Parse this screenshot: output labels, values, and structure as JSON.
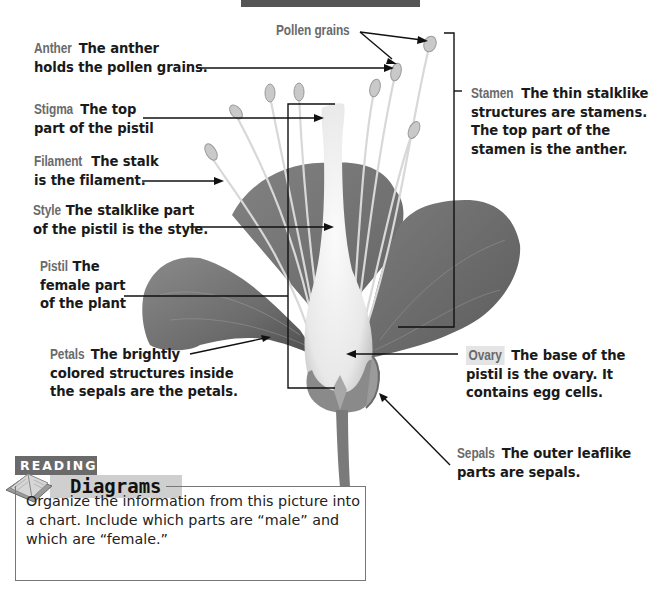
{
  "diagram": {
    "header_bar_color": "#555555",
    "label_term_color": "#6a6a6a",
    "labels": [
      {
        "id": "anther",
        "term": "Anther",
        "lines": [
          "The anther",
          "holds the pollen grains."
        ]
      },
      {
        "id": "stigma",
        "term": "Stigma",
        "lines": [
          "The top",
          "part of the pistil"
        ]
      },
      {
        "id": "filament",
        "term": "Filament",
        "lines": [
          "The stalk",
          "is the filament."
        ]
      },
      {
        "id": "style",
        "term": "Style",
        "lines": [
          "The stalklike part",
          "of the pistil is the style."
        ]
      },
      {
        "id": "pistil",
        "term": "Pistil",
        "lines": [
          "The",
          "female part",
          "of the plant"
        ]
      },
      {
        "id": "petals",
        "term": "Petals",
        "lines": [
          "The brightly",
          "colored structures inside",
          "the sepals are the petals."
        ]
      },
      {
        "id": "pollen",
        "term": "Pollen grains",
        "lines": []
      },
      {
        "id": "stamen",
        "term": "Stamen",
        "lines": [
          "The thin stalklike",
          "structures are stamens.",
          "The top part of the",
          "stamen is the anther."
        ]
      },
      {
        "id": "ovary",
        "term": "Ovary",
        "lines": [
          "The base of the",
          "pistil is the ovary. It",
          "contains egg cells."
        ]
      },
      {
        "id": "sepals",
        "term": "Sepals",
        "lines": [
          "The outer leaflike",
          "parts are sepals."
        ]
      }
    ]
  },
  "reading_box": {
    "tag": "READING",
    "title": "Diagrams",
    "icon": "open-book-icon",
    "text": "Organize the information from this picture into a chart. Include which parts are “male” and which are “female.”"
  }
}
